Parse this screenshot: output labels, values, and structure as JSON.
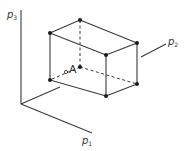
{
  "diagram": {
    "axes": {
      "p1": {
        "letter": "p",
        "index": "1"
      },
      "p2": {
        "letter": "p",
        "index": "2"
      },
      "p3": {
        "letter": "p",
        "index": "3"
      }
    },
    "point": {
      "label": "A"
    },
    "colors": {
      "line": "#3a3a3a",
      "vertex": "#1a1a1a",
      "label": "#333333",
      "background": "#ffffff"
    }
  }
}
